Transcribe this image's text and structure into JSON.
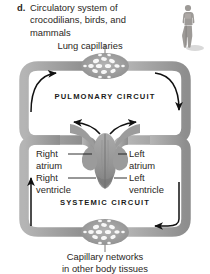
{
  "figure": {
    "item_letter": "d.",
    "caption": "Circulatory system of crocodilians, birds, and mammals",
    "colors": {
      "vessel": "#a6a6a6",
      "vessel_shadow": "#8c8c8c",
      "heart": "#9a9a9a",
      "heart_dark": "#7d7d7d",
      "text": "#2b2724",
      "arrow": "#111111",
      "background": "#ffffff"
    }
  },
  "labels": {
    "lung_capillaries": "Lung capillaries",
    "pulmonary_circuit": "PULMONARY CIRCUIT",
    "systemic_circuit": "SYSTEMIC CIRCUIT",
    "right_atrium": "Right\natrium",
    "right_atrium_line1": "Right",
    "right_atrium_line2": "atrium",
    "left_atrium_line1": "Left",
    "left_atrium_line2": "atrium",
    "right_ventricle_line1": "Right",
    "right_ventricle_line2": "ventricle",
    "left_ventricle_line1": "Left",
    "left_ventricle_line2": "ventricle",
    "capillary_networks_line1": "Capillary networks",
    "capillary_networks_line2": "in other body tissues"
  },
  "icons": {
    "human_figure": "human-silhouette-icon",
    "lung_capillary_bed": "capillary-network-icon",
    "body_capillary_bed": "capillary-network-icon",
    "heart": "heart-icon"
  },
  "flow_arrows": [
    {
      "name": "pulmonary-left-arrow",
      "direction": "up-right"
    },
    {
      "name": "pulmonary-right-arrow",
      "direction": "down"
    },
    {
      "name": "heart-left-arrow",
      "direction": "left"
    },
    {
      "name": "heart-right-arrow",
      "direction": "right"
    },
    {
      "name": "systemic-left-arrow",
      "direction": "up"
    },
    {
      "name": "systemic-right-arrow",
      "direction": "left"
    }
  ]
}
